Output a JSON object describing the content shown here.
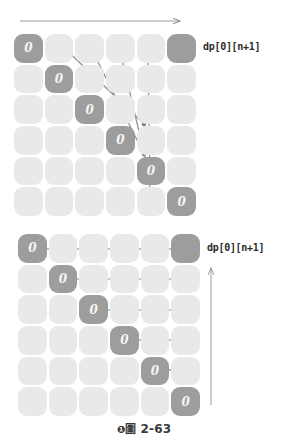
{
  "figure": {
    "caption_marker": "❶",
    "caption_cjk": "圖",
    "caption_number": "2-63",
    "caption_full": "❶圖 2-63"
  },
  "colors": {
    "cell_filled": "#9d9d9d",
    "cell_empty": "#e9e9e9",
    "arrow": "#8a8a8a",
    "arrow_dark": "#6f6f6f",
    "text": "#2b2b2b",
    "cell_text": "#f4f4f4",
    "background": "#ffffff"
  },
  "diagrams": [
    {
      "id": "top",
      "name": "diagonal-traversal-diagram",
      "grid": {
        "rows": 6,
        "cols": 6,
        "cell_value": "0",
        "filled_cells": [
          {
            "row": 0,
            "col": 0,
            "value": "0"
          },
          {
            "row": 1,
            "col": 1,
            "value": "0"
          },
          {
            "row": 2,
            "col": 2,
            "value": "0"
          },
          {
            "row": 3,
            "col": 3,
            "value": "0"
          },
          {
            "row": 4,
            "col": 4,
            "value": "0"
          },
          {
            "row": 5,
            "col": 5,
            "value": "0"
          },
          {
            "row": 0,
            "col": 5,
            "value": ""
          }
        ]
      },
      "top_arrow": {
        "label": "",
        "direction": "right"
      },
      "diagonal_arrows": [
        {
          "from_row": 0,
          "from_col": 1,
          "to_row": 1,
          "to_col": 5
        },
        {
          "from_row": 0,
          "from_col": 2,
          "to_row": 2,
          "to_col": 5
        },
        {
          "from_row": 0,
          "from_col": 3,
          "to_row": 3,
          "to_col": 5
        },
        {
          "from_row": 0,
          "from_col": 4,
          "to_row": 4,
          "to_col": 5
        }
      ],
      "label": "dp[0][n+1]"
    },
    {
      "id": "bottom",
      "name": "row-traversal-diagram",
      "grid": {
        "rows": 6,
        "cols": 6,
        "cell_value": "0",
        "filled_cells": [
          {
            "row": 0,
            "col": 0,
            "value": "0"
          },
          {
            "row": 1,
            "col": 1,
            "value": "0"
          },
          {
            "row": 2,
            "col": 2,
            "value": "0"
          },
          {
            "row": 3,
            "col": 3,
            "value": "0"
          },
          {
            "row": 4,
            "col": 4,
            "value": "0"
          },
          {
            "row": 5,
            "col": 5,
            "value": "0"
          },
          {
            "row": 0,
            "col": 5,
            "value": ""
          }
        ]
      },
      "horizontal_arrows": [
        {
          "row": 0,
          "from_col": 0,
          "to_col": 5
        },
        {
          "row": 1,
          "from_col": 1,
          "to_col": 5
        },
        {
          "row": 2,
          "from_col": 2,
          "to_col": 5
        },
        {
          "row": 3,
          "from_col": 3,
          "to_col": 5
        },
        {
          "row": 4,
          "from_col": 4,
          "to_col": 5
        }
      ],
      "vertical_arrow": {
        "direction": "up"
      },
      "label": "dp[0][n+1]"
    }
  ]
}
